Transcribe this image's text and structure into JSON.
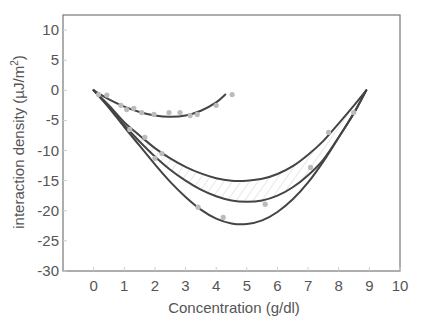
{
  "chart_data": {
    "type": "line",
    "title": "",
    "xlabel": "Concentration (g/dl)",
    "ylabel": "interaction density (µJ/m²)",
    "ylabel_parts": {
      "main": "interaction density (µJ/m",
      "sup": "2",
      "close": ")"
    },
    "xlim": [
      -1,
      10
    ],
    "ylim": [
      -30,
      12.5
    ],
    "xticks": [
      0,
      1,
      2,
      3,
      4,
      5,
      6,
      7,
      8,
      9,
      10
    ],
    "yticks": [
      10,
      5,
      0,
      -5,
      -10,
      -15,
      -20,
      -25,
      -30
    ],
    "grid": false,
    "legend": null,
    "colors": {
      "curve": "#444444",
      "points": "#bbbbbb",
      "axis": "#777777",
      "text": "#555555",
      "hatch": "#cccccc"
    },
    "series": [
      {
        "name": "small-fit",
        "style": "line",
        "x": [
          0,
          0.5,
          1.0,
          1.5,
          2.0,
          2.5,
          3.0,
          3.5,
          4.0,
          4.3
        ],
        "y": [
          0,
          -1.5,
          -2.7,
          -3.6,
          -4.2,
          -4.4,
          -4.2,
          -3.4,
          -2.0,
          -0.7
        ]
      },
      {
        "name": "upper-fit",
        "style": "line",
        "x": [
          0,
          0.5,
          1,
          1.5,
          2,
          2.5,
          3,
          3.5,
          4,
          4.5,
          5,
          5.5,
          6,
          6.5,
          7,
          7.5,
          8,
          8.5,
          8.9
        ],
        "y": [
          0,
          -2.5,
          -5.3,
          -7.5,
          -9.6,
          -11.3,
          -12.7,
          -13.8,
          -14.6,
          -15.0,
          -15.0,
          -14.7,
          -13.9,
          -12.6,
          -10.7,
          -8.4,
          -5.5,
          -2.5,
          0
        ]
      },
      {
        "name": "middle-fit",
        "style": "line",
        "x": [
          0,
          0.5,
          1,
          1.5,
          2,
          2.5,
          3,
          3.5,
          4,
          4.5,
          5,
          5.5,
          6,
          6.5,
          7,
          7.5,
          8,
          8.5,
          8.9
        ],
        "y": [
          0,
          -2.7,
          -5.8,
          -8.5,
          -11.0,
          -13.2,
          -15.0,
          -16.5,
          -17.6,
          -18.3,
          -18.5,
          -18.3,
          -17.5,
          -16.1,
          -14.1,
          -11.5,
          -7.8,
          -3.7,
          0
        ]
      },
      {
        "name": "lower-fit",
        "style": "line",
        "x": [
          0,
          0.5,
          1,
          1.5,
          2,
          2.5,
          3,
          3.5,
          4,
          4.5,
          5,
          5.5,
          6,
          6.5,
          7,
          7.5,
          8,
          8.5,
          8.9
        ],
        "y": [
          0,
          -2.9,
          -6.1,
          -9.2,
          -12.3,
          -15.2,
          -17.7,
          -19.8,
          -21.3,
          -22.1,
          -22.2,
          -21.6,
          -20.2,
          -18.1,
          -15.3,
          -11.8,
          -7.8,
          -3.8,
          0
        ]
      },
      {
        "name": "data-points",
        "style": "scatter",
        "x": [
          0.16,
          0.43,
          0.89,
          1.08,
          1.31,
          1.57,
          1.97,
          2.46,
          2.82,
          3.15,
          3.38,
          4.0,
          4.52,
          1.18,
          1.67,
          2.23,
          2.0,
          3.41,
          4.23,
          5.6,
          7.08,
          7.67,
          8.49
        ],
        "y": [
          -0.7,
          -0.8,
          -2.5,
          -3.2,
          -3.0,
          -3.7,
          -4.0,
          -3.7,
          -3.7,
          -4.2,
          -4.0,
          -2.5,
          -0.7,
          -6.5,
          -7.8,
          -10.5,
          -11.3,
          -19.4,
          -21.1,
          -18.9,
          -12.8,
          -7.0,
          -3.7
        ]
      }
    ],
    "annotations": [
      {
        "type": "hatched-region",
        "between": [
          "upper-fit",
          "middle-fit"
        ]
      }
    ]
  }
}
